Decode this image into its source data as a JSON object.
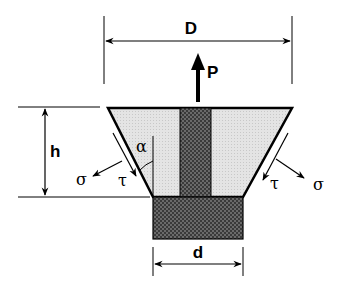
{
  "diagram": {
    "type": "engineering-free-body-diagram",
    "labels": {
      "outer_diameter": "D",
      "inner_diameter": "d",
      "height": "h",
      "load": "P",
      "angle": "α",
      "normal_stress_left": "σ",
      "shear_stress_left": "τ",
      "normal_stress_right": "σ",
      "shear_stress_right": "τ"
    },
    "colors": {
      "stroke": "#000000",
      "frustum_fill": "#e6e6e6",
      "rod_fill": "#5a5a5a",
      "block_fill": "#5a5a5a"
    }
  }
}
